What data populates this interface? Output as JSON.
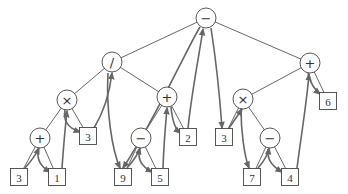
{
  "diagram": {
    "type": "expression-tree-traversal",
    "nodes": [
      {
        "id": "n0",
        "kind": "operator",
        "label": "−",
        "x": 206,
        "y": 18
      },
      {
        "id": "n1",
        "kind": "operator",
        "label": "/",
        "x": 112,
        "y": 62
      },
      {
        "id": "n2",
        "kind": "operator",
        "label": "+",
        "x": 310,
        "y": 63
      },
      {
        "id": "n3",
        "kind": "operator",
        "label": "×",
        "x": 67,
        "y": 100
      },
      {
        "id": "n4",
        "kind": "operator",
        "label": "+",
        "x": 167,
        "y": 97
      },
      {
        "id": "n5",
        "kind": "operator",
        "label": "×",
        "x": 243,
        "y": 99
      },
      {
        "id": "n6",
        "kind": "operand",
        "label": "6",
        "x": 328,
        "y": 101
      },
      {
        "id": "n7",
        "kind": "operator",
        "label": "+",
        "x": 40,
        "y": 138
      },
      {
        "id": "n8",
        "kind": "operand",
        "label": "3",
        "x": 88,
        "y": 136
      },
      {
        "id": "n9",
        "kind": "operator",
        "label": "−",
        "x": 141,
        "y": 138
      },
      {
        "id": "n10",
        "kind": "operand",
        "label": "2",
        "x": 188,
        "y": 137
      },
      {
        "id": "n11",
        "kind": "operand",
        "label": "3",
        "x": 224,
        "y": 137
      },
      {
        "id": "n12",
        "kind": "operator",
        "label": "−",
        "x": 270,
        "y": 138
      },
      {
        "id": "n13",
        "kind": "operand",
        "label": "3",
        "x": 19,
        "y": 177
      },
      {
        "id": "n14",
        "kind": "operand",
        "label": "1",
        "x": 57,
        "y": 177
      },
      {
        "id": "n15",
        "kind": "operand",
        "label": "9",
        "x": 123,
        "y": 177
      },
      {
        "id": "n16",
        "kind": "operand",
        "label": "5",
        "x": 160,
        "y": 177
      },
      {
        "id": "n17",
        "kind": "operand",
        "label": "7",
        "x": 252,
        "y": 177
      },
      {
        "id": "n18",
        "kind": "operand",
        "label": "4",
        "x": 290,
        "y": 177
      }
    ],
    "edges": [
      [
        "n0",
        "n1"
      ],
      [
        "n0",
        "n2"
      ],
      [
        "n1",
        "n3"
      ],
      [
        "n1",
        "n4"
      ],
      [
        "n2",
        "n5"
      ],
      [
        "n2",
        "n6"
      ],
      [
        "n3",
        "n7"
      ],
      [
        "n3",
        "n8"
      ],
      [
        "n4",
        "n9"
      ],
      [
        "n4",
        "n10"
      ],
      [
        "n5",
        "n11"
      ],
      [
        "n5",
        "n12"
      ],
      [
        "n7",
        "n13"
      ],
      [
        "n7",
        "n14"
      ],
      [
        "n9",
        "n15"
      ],
      [
        "n9",
        "n16"
      ],
      [
        "n12",
        "n17"
      ],
      [
        "n12",
        "n18"
      ]
    ],
    "colors": {
      "edge": "#555555",
      "arrow": "#666666",
      "node_stroke": "#444444",
      "text": "#333333"
    }
  }
}
